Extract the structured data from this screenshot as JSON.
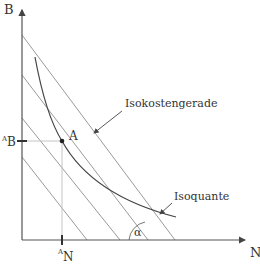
{
  "diagram": {
    "axes": {
      "y_label": "B",
      "x_label": "N",
      "y_tick_label_prefix": "A",
      "y_tick_label_main": "B",
      "x_tick_label_prefix": "A",
      "x_tick_label_main": "N"
    },
    "point": {
      "label": "A"
    },
    "annotations": {
      "isocost": "Isokostengerade",
      "isoquant": "Isoquante",
      "angle": "α"
    },
    "colors": {
      "axis": "#555555",
      "isocost_lines": "#9a9a9a",
      "isoquant_curve": "#444444",
      "guide_lines": "#bbbbbb",
      "text": "#333333"
    }
  }
}
